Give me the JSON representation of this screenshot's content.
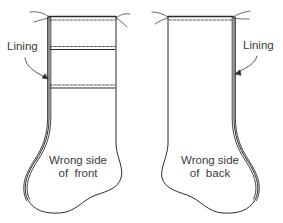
{
  "diagram": {
    "colors": {
      "stroke": "#2b2b2b",
      "text": "#3a3a3a",
      "background": "#ffffff"
    },
    "front": {
      "callout": "Lining",
      "caption_line1": "Wrong side",
      "caption_line2": "of  front"
    },
    "back": {
      "callout": "Lining",
      "caption_line1": "Wrong side",
      "caption_line2": "of  back"
    }
  }
}
